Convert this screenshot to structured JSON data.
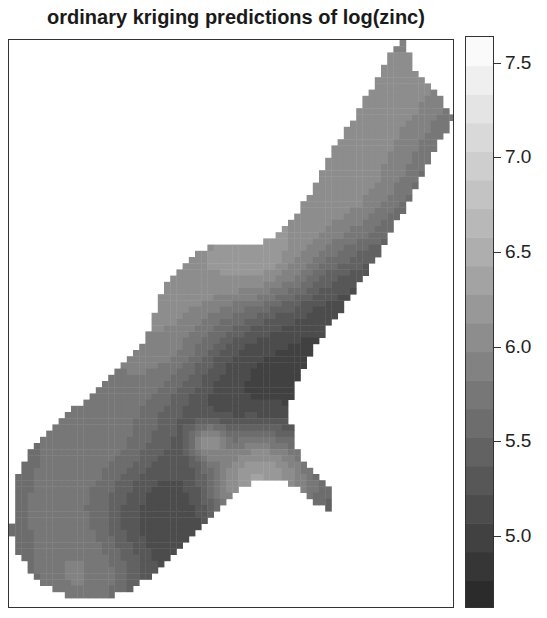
{
  "figure": {
    "title": "ordinary kriging predictions of log(zinc)"
  },
  "chart_data": {
    "type": "heatmap",
    "title": "ordinary kriging predictions of log(zinc)",
    "xlabel": "",
    "ylabel": "",
    "colorbar": {
      "min": 4.62,
      "max": 7.64,
      "ticks": [
        {
          "value": 7.5,
          "label": "7.5"
        },
        {
          "value": 7.0,
          "label": "7.0"
        },
        {
          "value": 6.5,
          "label": "6.5"
        },
        {
          "value": 6.0,
          "label": "6.0"
        },
        {
          "value": 5.5,
          "label": "5.5"
        },
        {
          "value": 5.0,
          "label": "5.0"
        }
      ],
      "n_bands": 20,
      "color_low": "#262626",
      "color_high": "#ffffff"
    },
    "grid": {
      "cell_px": 6.2,
      "comment_free_region_polygon_px": [
        [
          392,
          0
        ],
        [
          398,
          10
        ],
        [
          406,
          28
        ],
        [
          420,
          44
        ],
        [
          432,
          60
        ],
        [
          442,
          74
        ],
        [
          446,
          80
        ],
        [
          436,
          92
        ],
        [
          428,
          108
        ],
        [
          420,
          124
        ],
        [
          410,
          142
        ],
        [
          400,
          160
        ],
        [
          388,
          180
        ],
        [
          378,
          200
        ],
        [
          366,
          220
        ],
        [
          352,
          240
        ],
        [
          340,
          258
        ],
        [
          326,
          278
        ],
        [
          314,
          296
        ],
        [
          302,
          314
        ],
        [
          292,
          330
        ],
        [
          284,
          350
        ],
        [
          280,
          372
        ],
        [
          284,
          400
        ],
        [
          292,
          416
        ],
        [
          304,
          428
        ],
        [
          316,
          440
        ],
        [
          324,
          452
        ],
        [
          324,
          470
        ],
        [
          316,
          470
        ],
        [
          300,
          458
        ],
        [
          286,
          446
        ],
        [
          264,
          438
        ],
        [
          246,
          442
        ],
        [
          232,
          448
        ],
        [
          220,
          456
        ],
        [
          206,
          470
        ],
        [
          192,
          486
        ],
        [
          178,
          502
        ],
        [
          164,
          516
        ],
        [
          150,
          530
        ],
        [
          134,
          542
        ],
        [
          118,
          552
        ],
        [
          90,
          560
        ],
        [
          62,
          558
        ],
        [
          40,
          548
        ],
        [
          20,
          530
        ],
        [
          8,
          510
        ],
        [
          4,
          494
        ],
        [
          0,
          494
        ],
        [
          0,
          486
        ],
        [
          8,
          478
        ],
        [
          8,
          440
        ],
        [
          16,
          420
        ],
        [
          28,
          400
        ],
        [
          44,
          386
        ],
        [
          60,
          372
        ],
        [
          78,
          360
        ],
        [
          94,
          346
        ],
        [
          108,
          330
        ],
        [
          120,
          318
        ],
        [
          134,
          302
        ],
        [
          144,
          284
        ],
        [
          148,
          264
        ],
        [
          154,
          248
        ],
        [
          166,
          236
        ],
        [
          176,
          224
        ],
        [
          190,
          212
        ],
        [
          206,
          206
        ],
        [
          226,
          204
        ],
        [
          246,
          206
        ],
        [
          262,
          198
        ],
        [
          278,
          186
        ],
        [
          290,
          170
        ],
        [
          302,
          150
        ],
        [
          312,
          132
        ],
        [
          322,
          114
        ],
        [
          334,
          94
        ],
        [
          346,
          76
        ],
        [
          358,
          56
        ],
        [
          370,
          36
        ],
        [
          380,
          16
        ],
        [
          388,
          4
        ]
      ],
      "base_value": 5.1,
      "hotspots": [
        {
          "x": 400,
          "y": 30,
          "r": 70,
          "value": 7.0,
          "w": 0.9
        },
        {
          "x": 345,
          "y": 120,
          "r": 70,
          "value": 6.9,
          "w": 0.9
        },
        {
          "x": 310,
          "y": 175,
          "r": 55,
          "value": 6.9,
          "w": 0.85
        },
        {
          "x": 190,
          "y": 228,
          "r": 70,
          "value": 7.2,
          "w": 0.85
        },
        {
          "x": 258,
          "y": 215,
          "r": 45,
          "value": 7.3,
          "w": 0.8
        },
        {
          "x": 140,
          "y": 300,
          "r": 55,
          "value": 6.8,
          "w": 0.75
        },
        {
          "x": 80,
          "y": 390,
          "r": 70,
          "value": 6.6,
          "w": 0.85
        },
        {
          "x": 35,
          "y": 470,
          "r": 55,
          "value": 6.3,
          "w": 0.7
        },
        {
          "x": 70,
          "y": 540,
          "r": 55,
          "value": 6.7,
          "w": 0.8
        },
        {
          "x": 250,
          "y": 440,
          "r": 45,
          "value": 7.6,
          "w": 1.0
        },
        {
          "x": 200,
          "y": 402,
          "r": 16,
          "value": 7.1,
          "w": 0.85
        },
        {
          "x": 300,
          "y": 455,
          "r": 40,
          "value": 6.1,
          "w": 0.6
        },
        {
          "x": 260,
          "y": 330,
          "r": 70,
          "value": 4.8,
          "w": 0.7
        },
        {
          "x": 150,
          "y": 470,
          "r": 45,
          "value": 4.9,
          "w": 0.6
        },
        {
          "x": 330,
          "y": 230,
          "r": 60,
          "value": 5.0,
          "w": 0.5
        }
      ]
    }
  }
}
